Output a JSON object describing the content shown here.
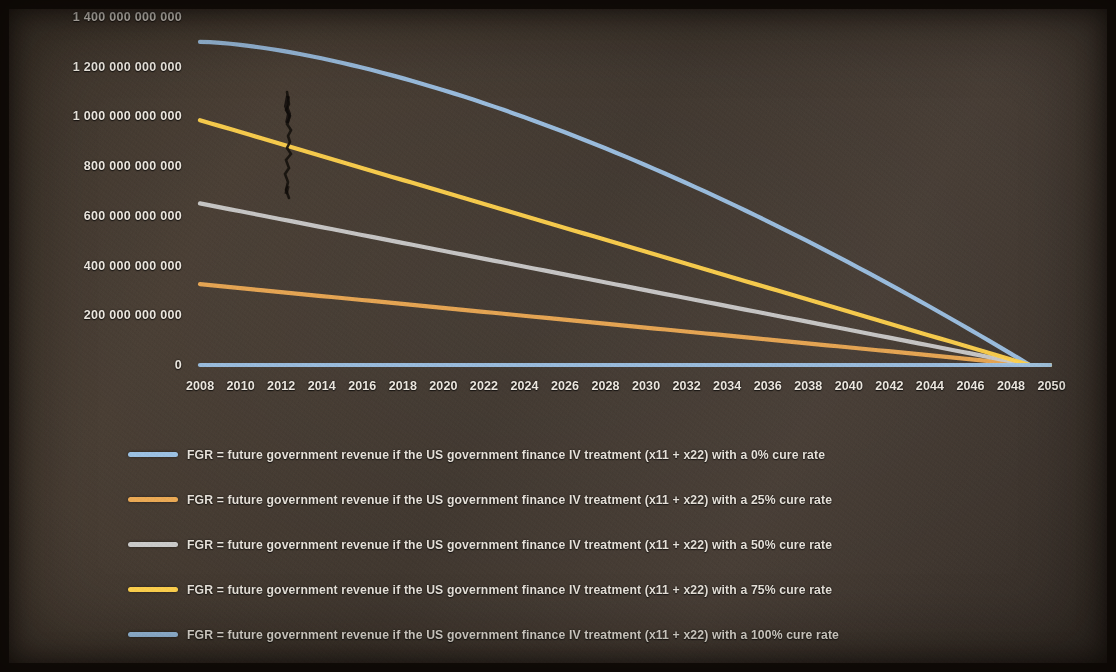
{
  "chart_data": {
    "type": "line",
    "title": "",
    "subtitle": "",
    "xlabel": "",
    "ylabel": "",
    "grid": false,
    "legend_position": "bottom",
    "x": [
      2008,
      2009,
      2010,
      2011,
      2012,
      2013,
      2014,
      2015,
      2016,
      2017,
      2018,
      2019,
      2020,
      2021,
      2022,
      2023,
      2024,
      2025,
      2026,
      2027,
      2028,
      2029,
      2030,
      2031,
      2032,
      2033,
      2034,
      2035,
      2036,
      2037,
      2038,
      2039,
      2040,
      2041,
      2042,
      2043,
      2044,
      2045,
      2046,
      2047,
      2048,
      2049,
      2050
    ],
    "xtick_labels": [
      "2008",
      "2010",
      "2012",
      "2014",
      "2016",
      "2018",
      "2020",
      "2022",
      "2024",
      "2026",
      "2028",
      "2030",
      "2032",
      "2034",
      "2036",
      "2038",
      "2040",
      "2042",
      "2044",
      "2046",
      "2048",
      "2050"
    ],
    "ytick_labels": [
      "1 400 000 000 000",
      "1 200 000 000 000",
      "1 000 000 000 000",
      "800 000 000 000",
      "600 000 000 000",
      "400 000 000 000",
      "200 000 000 000",
      "0"
    ],
    "ytick_values": [
      1400000000000,
      1200000000000,
      1000000000000,
      800000000000,
      600000000000,
      400000000000,
      200000000000,
      0
    ],
    "ylim": [
      0,
      1400000000000
    ],
    "xlim": [
      2008,
      2050
    ],
    "series": [
      {
        "name": "FGR = future government revenue if the US government finance IV treatment (x11 + x22) with a 0% cure rate",
        "short_name": "0% cure rate",
        "color": "#9dc3e6",
        "start_value": 1300000000000,
        "end_value": 0,
        "end_year": 2049,
        "curve": "convex"
      },
      {
        "name": "FGR = future government revenue if the US government finance IV treatment (x11 + x22) with a 25% cure rate",
        "short_name": "25% cure rate",
        "color": "#e8a martial",
        "start_value": 325000000000,
        "end_value": 0,
        "end_year": 2049,
        "curve": "linear"
      },
      {
        "name": "FGR = future government revenue if the US government finance IV treatment (x11 + x22) with a 50% cure rate",
        "short_name": "50% cure rate",
        "color": "#c9c9c9",
        "start_value": 650000000000,
        "end_value": 0,
        "end_year": 2049,
        "curve": "linear"
      },
      {
        "name": "FGR = future government revenue if the US government finance IV treatment (x11 + x22) with a 75% cure rate",
        "short_name": "75% cure rate",
        "color": "#ffd24d",
        "start_value": 985000000000,
        "end_value": 0,
        "end_year": 2049,
        "curve": "linear"
      },
      {
        "name": "FGR = future government revenue if the US government finance IV treatment (x11 + x22) with a 100% cure rate",
        "short_name": "100% cure rate",
        "color": "#9dc3e6",
        "start_value": 0,
        "end_value": 0,
        "end_year": 2050,
        "curve": "flat"
      }
    ]
  },
  "legend": {
    "items": [
      {
        "label": "FGR = future government revenue if the US government finance IV treatment (x11 + x22) with a 0% cure rate",
        "color": "#9dc3e6"
      },
      {
        "label": "FGR = future government revenue if the US government finance IV treatment (x11 + x22) with a 25% cure rate",
        "color": "#edab55"
      },
      {
        "label": "FGR = future government revenue if the US government finance IV treatment (x11 + x22) with a 50% cure rate",
        "color": "#cccccc"
      },
      {
        "label": "FGR = future government revenue if the US government finance IV treatment (x11 + x22) with a 75% cure rate",
        "color": "#ffd24d"
      },
      {
        "label": "FGR = future government revenue if the US government finance IV treatment (x11 + x22) with a 100% cure rate",
        "color": "#9dc3e6"
      }
    ]
  },
  "axes": {
    "y_labels": [
      "1 400 000 000 000",
      "1 200 000 000 000",
      "1 000 000 000 000",
      "800 000 000 000",
      "600 000 000 000",
      "400 000 000 000",
      "200 000 000 000",
      "0"
    ],
    "x_labels": [
      "2008",
      "2010",
      "2012",
      "2014",
      "2016",
      "2018",
      "2020",
      "2022",
      "2024",
      "2026",
      "2028",
      "2030",
      "2032",
      "2034",
      "2036",
      "2038",
      "2040",
      "2042",
      "2044",
      "2046",
      "2048",
      "2050"
    ]
  }
}
